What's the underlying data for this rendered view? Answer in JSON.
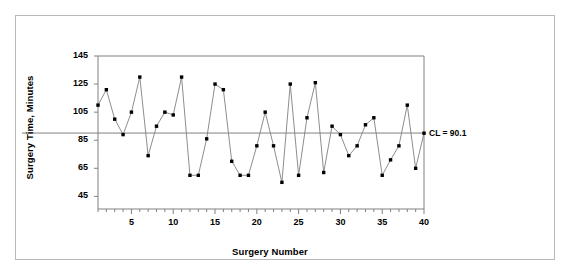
{
  "chart_data": {
    "type": "line",
    "title": "",
    "subtitle": "",
    "xlabel": "Surgery Number",
    "ylabel": "Surgery Time, Minutes",
    "xlim": [
      1,
      40
    ],
    "ylim": [
      36,
      145
    ],
    "yticks": [
      45,
      65,
      85,
      105,
      125,
      145
    ],
    "xticks": [
      5,
      10,
      15,
      20,
      25,
      30,
      35,
      40
    ],
    "xminorticks": [
      1,
      2,
      3,
      4,
      5,
      6,
      7,
      8,
      9,
      10,
      11,
      12,
      13,
      14,
      15,
      16,
      17,
      18,
      19,
      20,
      21,
      22,
      23,
      24,
      25,
      26,
      27,
      28,
      29,
      30,
      31,
      32,
      33,
      34,
      35,
      36,
      37,
      38,
      39,
      40
    ],
    "grid": false,
    "legend": null,
    "marker": "square",
    "marker_color": "#000000",
    "line_color": "#808080",
    "x": [
      1,
      2,
      3,
      4,
      5,
      6,
      7,
      8,
      9,
      10,
      11,
      12,
      13,
      14,
      15,
      16,
      17,
      18,
      19,
      20,
      21,
      22,
      23,
      24,
      25,
      26,
      27,
      28,
      29,
      30,
      31,
      32,
      33,
      34,
      35,
      36,
      37,
      38,
      39,
      40
    ],
    "values": [
      110,
      121,
      100,
      89,
      105,
      130,
      74,
      95,
      105,
      103,
      130,
      60,
      60,
      86,
      125,
      121,
      70,
      60,
      60,
      81,
      105,
      81,
      55,
      125,
      60,
      101,
      126,
      62,
      95,
      89,
      74,
      81,
      96,
      101,
      60,
      71,
      81,
      110,
      65,
      90
    ],
    "annotations": [
      {
        "name": "center-line",
        "label": "CL = 90.1",
        "type": "hline",
        "value": 90.1,
        "color": "#808080"
      }
    ]
  },
  "axes": {
    "y_title": "Surgery Time, Minutes",
    "x_title": "Surgery Number",
    "y_tick_labels": [
      "145",
      "125",
      "105",
      "85",
      "65",
      "45"
    ],
    "x_tick_labels": [
      "5",
      "10",
      "15",
      "20",
      "25",
      "30",
      "35",
      "40"
    ]
  },
  "colors": {
    "frame": "#808080",
    "outer_border": "#b9b9b9",
    "line": "#808080",
    "marker": "#000000",
    "text": "#000000",
    "background": "#ffffff"
  }
}
